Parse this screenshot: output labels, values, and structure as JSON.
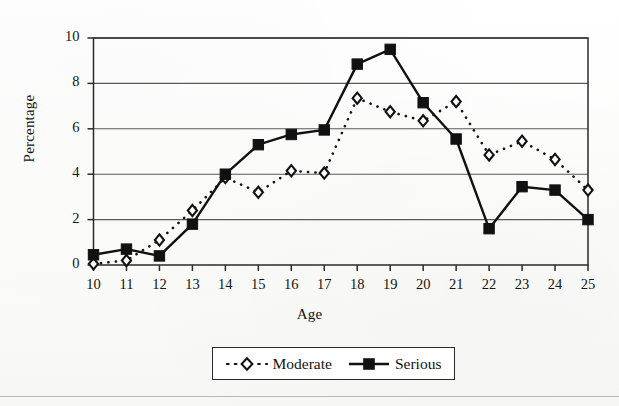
{
  "chart_data": {
    "type": "line",
    "title": "",
    "xlabel": "Age",
    "ylabel": "Percentage",
    "xlim": [
      10,
      25
    ],
    "ylim": [
      0,
      10
    ],
    "xticks": [
      "10",
      "11",
      "12",
      "13",
      "14",
      "15",
      "16",
      "17",
      "18",
      "19",
      "20",
      "21",
      "22",
      "23",
      "24",
      "25"
    ],
    "yticks": [
      "0",
      "2",
      "4",
      "6",
      "8",
      "10"
    ],
    "grid": "horizontal",
    "legend_position": "bottom-outside",
    "x": [
      10,
      11,
      12,
      13,
      14,
      15,
      16,
      17,
      18,
      19,
      20,
      21,
      22,
      23,
      24,
      25
    ],
    "series": [
      {
        "name": "Moderate",
        "marker": "open-diamond",
        "line_style": "dotted",
        "color": "#111111",
        "values": [
          0.05,
          0.2,
          1.1,
          2.4,
          3.85,
          3.2,
          4.15,
          4.05,
          7.35,
          6.75,
          6.35,
          7.2,
          4.85,
          5.45,
          4.65,
          3.3
        ]
      },
      {
        "name": "Serious",
        "marker": "filled-square",
        "line_style": "solid",
        "color": "#111111",
        "values": [
          0.45,
          0.7,
          0.4,
          1.8,
          4.0,
          5.3,
          5.75,
          5.95,
          8.85,
          9.5,
          7.15,
          5.55,
          1.6,
          3.45,
          3.3,
          2.0
        ]
      }
    ]
  },
  "legend": {
    "entries": [
      {
        "label": "Moderate"
      },
      {
        "label": "Serious"
      }
    ]
  },
  "colors": {
    "ink": "#111111",
    "grid": "#5a5a5a",
    "frame": "#2a2a2a",
    "paper": "#fdfdfc"
  }
}
